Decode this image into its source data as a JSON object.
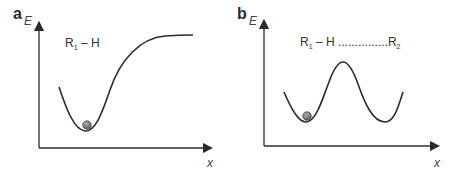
{
  "figure": {
    "panels": [
      {
        "id": "a",
        "letter": "a",
        "y_axis_label": "E",
        "x_axis_label": "x",
        "annotation": {
          "species": "R",
          "subscript": "1",
          "suffix": " – H"
        },
        "curve_type": "single well rising to plateau",
        "ball_position": "bottom of well"
      },
      {
        "id": "b",
        "letter": "b",
        "y_axis_label": "E",
        "x_axis_label": "x",
        "annotation": {
          "species": "R",
          "subscript": "1",
          "suffix": " – H ...............",
          "species2": "R",
          "subscript2": "2"
        },
        "curve_type": "symmetric double well with barrier",
        "ball_position": "bottom of left well"
      }
    ],
    "colors": {
      "line": "#2b2b2b",
      "ball_fill": "#7a7a7a",
      "ball_highlight": "#b0b0b0",
      "background": "#ffffff"
    }
  }
}
